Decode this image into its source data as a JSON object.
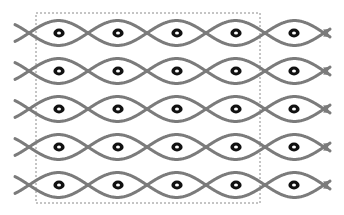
{
  "diagram": {
    "colors": {
      "background": "#ffffff",
      "strand": "#7b7b7b",
      "dot_outer": "#111111",
      "dot_inner": "#ffffff",
      "dashed_frame": "#8a8a8a"
    },
    "frame": {
      "x": 36,
      "y": 13,
      "width": 224,
      "height": 190,
      "dash": "2,2"
    },
    "strands": {
      "count_rows": 5,
      "row_centers": [
        33,
        71,
        109,
        147,
        185
      ],
      "crossing_x": [
        29,
        88,
        147,
        206,
        265,
        324
      ],
      "lens_half_height": 12,
      "stroke_width": 3,
      "x_start": 15,
      "x_end": 330,
      "arrowheads": true
    },
    "dots": {
      "columns": [
        59,
        118,
        177,
        236,
        294
      ],
      "rows": [
        33,
        71,
        109,
        147,
        185
      ],
      "outer_radius": 5,
      "inner_radius": 1.6
    }
  }
}
